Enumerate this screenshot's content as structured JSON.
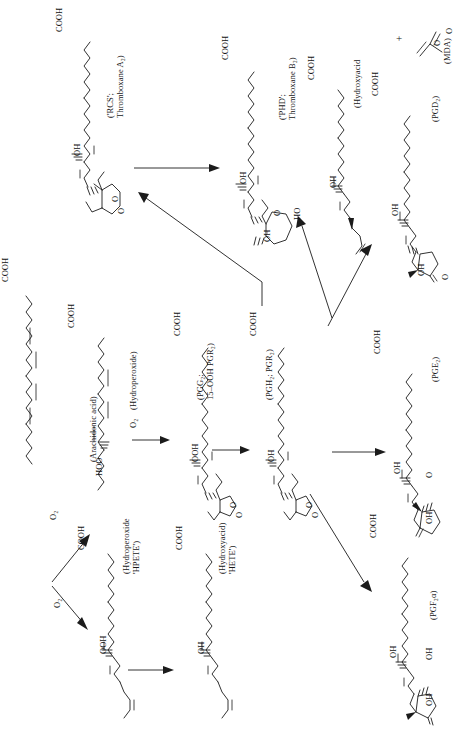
{
  "figure": {
    "orientation": "landscape-rotated-90ccw",
    "background_color": "#ffffff",
    "ink_color": "#1b1b1b"
  },
  "atom_labels": {
    "cooh": "COOH",
    "ooh": "OOH",
    "oh": "OH",
    "ho": "HO",
    "hoo": "HOO",
    "o": "O",
    "o2": "O₂",
    "plus": "+"
  },
  "nodes": [
    {
      "id": "arachidonic-acid",
      "label": "(Arachidonic acid)",
      "label_lines": [
        "(Arachidonic acid)"
      ],
      "atoms": [
        "COOH"
      ]
    },
    {
      "id": "hydroperoxide",
      "label": "(Hydroperoxide)",
      "label_lines": [
        "(Hydroperoxide)"
      ],
      "atoms": [
        "COOH",
        "HOO"
      ]
    },
    {
      "id": "pgg2",
      "label": "(PGG₂; 15–OOH PGR₂)",
      "label_lines": [
        "(PGG₂;",
        "15–OOH PGR₂)"
      ],
      "atoms": [
        "COOH",
        "OOH",
        "O",
        "O"
      ]
    },
    {
      "id": "pgh2",
      "label": "(PGH₂; PGR₂)",
      "label_lines": [
        "(PGH₂; PGR₂)"
      ],
      "atoms": [
        "COOH",
        "OH",
        "O",
        "O"
      ]
    },
    {
      "id": "txa2",
      "label": "('RCS'; Thromboxane A₂)",
      "label_lines": [
        "('RCS';",
        "Thromboxane A₂)"
      ],
      "atoms": [
        "COOH",
        "OH",
        "O",
        "O"
      ]
    },
    {
      "id": "txb2",
      "label": "('PHD'; Thromboxane B₂)",
      "label_lines": [
        "('PHD';",
        "Thromboxane B₂)"
      ],
      "atoms": [
        "COOH",
        "OH",
        "OH",
        "HO",
        "O"
      ]
    },
    {
      "id": "hydroxyacid-mda",
      "label": "(Hydroxyacid",
      "label_lines": [
        "(Hydroxyacid"
      ],
      "atoms": [
        "COOH",
        "OH"
      ]
    },
    {
      "id": "mda",
      "label": "(MDA)",
      "label_lines": [
        "(MDA)"
      ],
      "atoms": [
        "O",
        "O"
      ]
    },
    {
      "id": "pgd2",
      "label": "(PGD₂)",
      "label_lines": [
        "(PGD₂)"
      ],
      "atoms": [
        "COOH",
        "OH",
        "OH",
        "O"
      ]
    },
    {
      "id": "pge2",
      "label": "(PGE₂)",
      "label_lines": [
        "(PGE₂)"
      ],
      "atoms": [
        "COOH",
        "OH",
        "OH",
        "O"
      ]
    },
    {
      "id": "pgf2a",
      "label": "(PGF₂α)",
      "label_lines": [
        "(PGF₂α)"
      ],
      "atoms": [
        "COOH",
        "OH",
        "OH",
        "OH"
      ]
    },
    {
      "id": "hpete",
      "label": "(Hydroperoxide 'HPETE')",
      "label_lines": [
        "(Hydroperoxide",
        "'HPETE')"
      ],
      "atoms": [
        "COOH",
        "OOH"
      ]
    },
    {
      "id": "hete",
      "label": "(Hydroxyacid) 'HETE')",
      "label_lines": [
        "(Hydroxyacid)",
        "'HETE')"
      ],
      "atoms": [
        "COOH",
        "OH"
      ]
    }
  ],
  "reaction_arrows": [
    {
      "id": "aa-to-hydroperoxide",
      "label": "O₂",
      "from": "arachidonic-acid",
      "to": "hydroperoxide"
    },
    {
      "id": "aa-to-hpete",
      "label": "O₂",
      "from": "arachidonic-acid",
      "to": "hpete"
    },
    {
      "id": "hydroperoxide-to-pgg2",
      "label": "O₂",
      "from": "hydroperoxide",
      "to": "pgg2"
    },
    {
      "id": "pgg2-to-pgh2",
      "label": "",
      "from": "pgg2",
      "to": "pgh2"
    },
    {
      "id": "pgh2-to-txa2",
      "label": "",
      "from": "pgh2",
      "to": "txa2"
    },
    {
      "id": "txa2-to-txb2",
      "label": "",
      "from": "txa2",
      "to": "txb2"
    },
    {
      "id": "pgh2-to-hydroxyacid-mda",
      "label": "",
      "from": "pgh2",
      "to": "hydroxyacid-mda"
    },
    {
      "id": "pgh2-to-pgd2",
      "label": "",
      "from": "pgh2",
      "to": "pgd2"
    },
    {
      "id": "pgh2-to-pge2",
      "label": "",
      "from": "pgh2",
      "to": "pge2"
    },
    {
      "id": "pgh2-to-pgf2a",
      "label": "",
      "from": "pgh2",
      "to": "pgf2a"
    },
    {
      "id": "hpete-to-hete",
      "label": "",
      "from": "hpete",
      "to": "hete"
    }
  ]
}
